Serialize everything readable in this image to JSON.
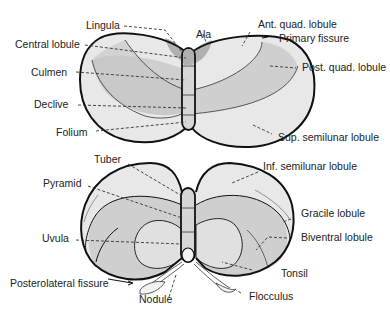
{
  "colors": {
    "outline": "#111111",
    "light": "#e8e8e8",
    "medium": "#cfcfcf",
    "dark": "#b8b8b8",
    "leader": "#333333",
    "text": "#222222"
  },
  "superior_view": {
    "labels": {
      "lingula": "Lingula",
      "ala": "Ala",
      "central_lobule": "Central lobule",
      "culmen": "Culmen",
      "declive": "Declive",
      "folium": "Folium",
      "ant_quad_lobule": "Ant. quad. lobule",
      "primary_fissure": "Primary fissure",
      "post_quad_lobule": "Post. quad. lobule",
      "sup_semilunar_lobule": "Sup. semilunar lobule"
    }
  },
  "inferior_view": {
    "labels": {
      "tuber": "Tuber",
      "pyramid": "Pyramid",
      "uvula": "Uvula",
      "posterolateral_fissure": "Posterolateral fissure",
      "nodule": "Nodule",
      "inf_semilunar_lobule": "Inf. semilunar lobule",
      "gracile_lobule": "Gracile lobule",
      "biventral_lobule": "Biventral lobule",
      "tonsil": "Tonsil",
      "flocculus": "Flocculus"
    }
  }
}
